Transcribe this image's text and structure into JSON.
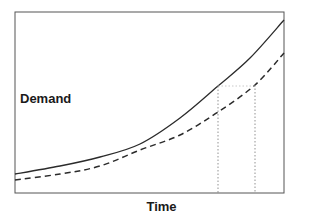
{
  "chart_data": {
    "type": "line",
    "title": "",
    "xlabel": "Time",
    "ylabel": "Demand",
    "grid": false,
    "legend": null,
    "x": [
      0,
      45,
      85,
      125,
      165,
      203,
      240,
      269
    ],
    "series": [
      {
        "name": "Demand (upper, solid)",
        "style": "solid",
        "values": [
          19,
          27,
          36,
          49,
          75,
          107,
          135,
          173
        ]
      },
      {
        "name": "Demand (lower, dashed)",
        "style": "dashed",
        "values": [
          13,
          19,
          27,
          43,
          58,
          81,
          108,
          140
        ]
      }
    ],
    "annotations": [
      {
        "type": "vertical-dotted-line",
        "x": 203,
        "from_series": "solid",
        "label": ""
      },
      {
        "type": "vertical-dotted-line",
        "x": 240,
        "from_series": "dashed",
        "label": ""
      },
      {
        "type": "horizontal-dotted-line",
        "y": 107,
        "x_range": [
          203,
          240
        ],
        "label": ""
      }
    ],
    "plot_frame_px": {
      "left": 15,
      "top": 12,
      "right": 284,
      "bottom": 193
    },
    "curves_px": {
      "solid": [
        [
          15,
          174
        ],
        [
          60,
          166
        ],
        [
          100,
          157
        ],
        [
          140,
          144
        ],
        [
          180,
          118
        ],
        [
          218,
          86
        ],
        [
          250,
          58
        ],
        [
          284,
          20
        ]
      ],
      "dashed": [
        [
          15,
          180
        ],
        [
          60,
          174
        ],
        [
          100,
          166
        ],
        [
          140,
          150
        ],
        [
          180,
          135
        ],
        [
          218,
          112
        ],
        [
          255,
          85
        ],
        [
          284,
          53
        ]
      ]
    },
    "colors": {
      "line": "#2b2b2b",
      "frame": "#555555",
      "guide": "#777777"
    }
  },
  "labels": {
    "y_axis": "Demand",
    "x_axis": "Time"
  }
}
